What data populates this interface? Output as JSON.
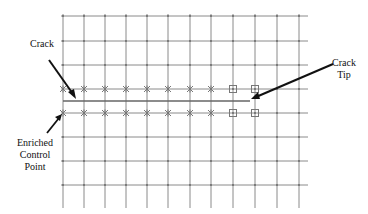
{
  "labels": {
    "crack": "Crack",
    "crack_tip_line1": "Crack",
    "crack_tip_line2": "Tip",
    "enriched_line1": "Enriched",
    "enriched_line2": "Control",
    "enriched_line3": "Point"
  },
  "grid": {
    "x_lines": [
      63,
      84,
      105,
      126,
      147,
      168,
      190,
      211,
      233,
      255,
      277,
      299
    ],
    "y_lines": [
      16,
      41,
      65,
      89,
      113,
      137,
      161,
      185
    ],
    "y_bottom": 208,
    "x_right": 308,
    "line_color": "#8a8a8a"
  },
  "crack": {
    "x1": 63,
    "x2": 250,
    "y": 101,
    "color": "#666666"
  },
  "markers": {
    "star_rows": [
      89,
      113
    ],
    "star_x": [
      63,
      84,
      105,
      126,
      147,
      168,
      190,
      211
    ],
    "square_x": [
      233,
      255
    ],
    "color": "#777777"
  },
  "colors": {
    "arrow": "#111111",
    "text": "#111111"
  }
}
